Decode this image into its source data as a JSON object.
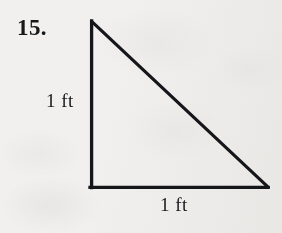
{
  "figure": {
    "item_number": "15.",
    "shape_name": "right-triangle",
    "stroke_color": "#15161a",
    "background_color": "#f1f0ee",
    "stroke_width": 3.2,
    "vertices": {
      "apex": {
        "x": 91,
        "y": 21
      },
      "bottom_left": {
        "x": 91,
        "y": 187
      },
      "bottom_right": {
        "x": 268,
        "y": 187
      }
    },
    "labels": {
      "vertical_leg": "1 ft",
      "horizontal_leg": "1 ft"
    }
  }
}
